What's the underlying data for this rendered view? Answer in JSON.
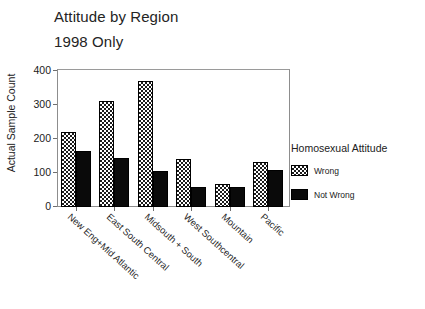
{
  "chart_data": {
    "type": "bar",
    "title": "Attitude by Region",
    "subtitle": "1998 Only",
    "xlabel": "",
    "ylabel": "Actual Sample Count",
    "ylim": [
      0,
      400
    ],
    "yticks": [
      "0",
      "100",
      "200",
      "300",
      "400"
    ],
    "grid": false,
    "legend_position": "right",
    "legend_title": "Homosexual Attitude",
    "categories": [
      "New Eng+Mid Atlantic",
      "East South Central",
      "Midsouth + South",
      "West Southcentral",
      "Mountain",
      "Pacific"
    ],
    "series": [
      {
        "name": "Wrong",
        "values": [
          220,
          312,
          370,
          141,
          69,
          132
        ]
      },
      {
        "name": "Not Wrong",
        "values": [
          165,
          145,
          106,
          58,
          60,
          108
        ]
      }
    ]
  },
  "colors": {
    "wrong_fill": "#1b1b1b",
    "notwrong_fill": "#0a0a0a",
    "axis": "#8d8d8d",
    "text": "#212121",
    "background": "#ffffff"
  }
}
